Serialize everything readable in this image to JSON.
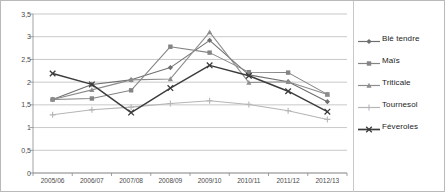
{
  "chart_data": {
    "type": "line",
    "title": "",
    "xlabel": "",
    "ylabel": "",
    "categories": [
      "2005/06",
      "2006/07",
      "2007/08",
      "2008/09",
      "2009/10",
      "2010/11",
      "2011/12",
      "2012/13"
    ],
    "ylim": [
      0,
      3.5
    ],
    "ytick_labels": [
      "0",
      "0,5",
      "1",
      "1,5",
      "2",
      "2,5",
      "3",
      "3,5"
    ],
    "ytick_values": [
      0,
      0.5,
      1,
      1.5,
      2,
      2.5,
      3,
      3.5
    ],
    "grid": true,
    "legend_position": "right",
    "series": [
      {
        "name": "Blé tendre",
        "marker": "diamond",
        "color": "#6f6f6f",
        "values": [
          1.62,
          1.95,
          2.05,
          2.32,
          2.92,
          2.16,
          2.01,
          1.57
        ]
      },
      {
        "name": "Maïs",
        "marker": "square",
        "color": "#848484",
        "values": [
          1.62,
          1.64,
          1.82,
          2.78,
          2.65,
          2.22,
          2.21,
          1.73
        ]
      },
      {
        "name": "Triticale",
        "marker": "triangle",
        "color": "#8d8d8d",
        "values": [
          1.62,
          1.83,
          2.05,
          2.07,
          3.1,
          1.99,
          2.01,
          1.73
        ]
      },
      {
        "name": "Tournesol",
        "marker": "cross",
        "color": "#b5b5b5",
        "values": [
          1.28,
          1.39,
          1.45,
          1.53,
          1.59,
          1.51,
          1.37,
          1.18
        ]
      },
      {
        "name": "Féveroles",
        "marker": "x",
        "color": "#3c3c3c",
        "values": [
          2.19,
          1.95,
          1.33,
          1.87,
          2.37,
          2.14,
          1.8,
          1.35
        ]
      }
    ]
  }
}
